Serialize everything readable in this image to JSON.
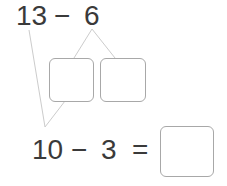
{
  "problem": {
    "top_expression": "13 − 6",
    "minuend": "13",
    "operator": "−",
    "subtrahend": "6"
  },
  "decomposition_boxes": [
    {
      "value": ""
    },
    {
      "value": ""
    }
  ],
  "bottom_equation": {
    "left": "10",
    "operator": "−",
    "right": "3",
    "equals": "=",
    "answer": ""
  },
  "colors": {
    "text": "#3a3a3a",
    "lines": "#c8c8c8",
    "box_border": "#a8a8a8"
  }
}
